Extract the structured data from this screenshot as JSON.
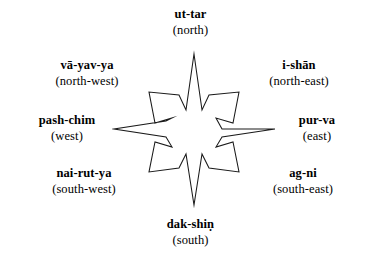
{
  "figure": {
    "background_color": "#ffffff",
    "stroke_color": "#1a1a1a"
  },
  "directions": [
    {
      "key": "north",
      "term": "ut-tar",
      "gloss": "(north)"
    },
    {
      "key": "northeast",
      "term": "i-shān",
      "gloss": "(north-east)"
    },
    {
      "key": "east",
      "term": "pur-va",
      "gloss": "(east)"
    },
    {
      "key": "southeast",
      "term": "ag-ni",
      "gloss": "(south-east)"
    },
    {
      "key": "south",
      "term": "dak-shiṇ",
      "gloss": "(south)"
    },
    {
      "key": "southwest",
      "term": "nai-rut-ya",
      "gloss": "(south-west)"
    },
    {
      "key": "west",
      "term": "pash-chim",
      "gloss": "(west)"
    },
    {
      "key": "northwest",
      "term": "vā-yav-ya",
      "gloss": "(north-west)"
    }
  ],
  "star": {
    "shape_name": "eight-pointed-compass-star",
    "cardinal_points": "sharp",
    "diagonal_points": "blunt-truncated"
  }
}
